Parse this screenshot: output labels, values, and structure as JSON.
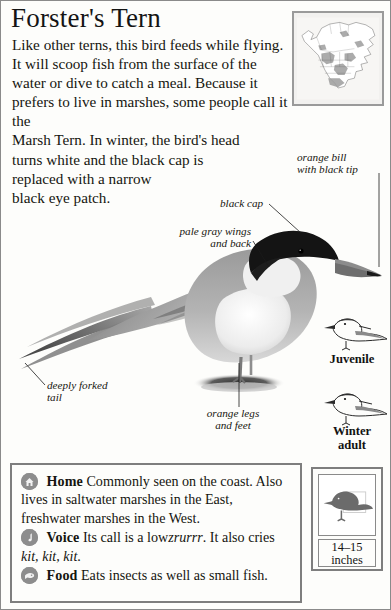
{
  "title": "Forster's Tern",
  "intro": {
    "line1": "Like other terns, this bird feeds while flying. It will scoop fish from the surface of the water or dive to catch a meal. Because it prefers to live in marshes, some people call it the",
    "line2": "Marsh Tern. In winter, the bird's head turns white and the black cap is",
    "line3": "replaced with a narrow black eye patch."
  },
  "map": {
    "name": "north-america-range-map"
  },
  "callouts": {
    "bill": "orange bill\nwith black tip",
    "cap": "black cap",
    "wings": "pale gray wings\nand back",
    "tail": "deeply forked\ntail",
    "legs": "orange legs\nand feet"
  },
  "figures": {
    "juvenile": "Juvenile",
    "winter_adult": "Winter\nadult"
  },
  "info": {
    "home": {
      "icon": "house-icon",
      "label": "Home",
      "text": "Commonly seen on the coast. Also lives in saltwater marshes in the East, freshwater marshes in the West."
    },
    "voice": {
      "icon": "music-note-icon",
      "label": "Voice",
      "text_before": "Its call is a low",
      "call1": "zrurrr",
      "text_middle": ". It also cries",
      "call2": "kit, kit, kit",
      "text_after": "."
    },
    "food": {
      "icon": "fish-icon",
      "label": "Food",
      "text": "Eats insects as well as small fish."
    }
  },
  "size": {
    "measurement": "14–15",
    "unit": "inches"
  },
  "colors": {
    "border": "#7e7e7e",
    "map_border": "#9a9a9a",
    "badge": "#8d8d8d",
    "text": "#15150f"
  }
}
